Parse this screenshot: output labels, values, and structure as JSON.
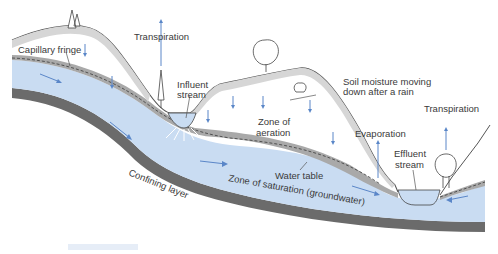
{
  "diagram": {
    "labels": {
      "capillary_fringe": "Capillary fringe",
      "transpiration_left": "Transpiration",
      "influent_stream_1": "Influent",
      "influent_stream_2": "stream",
      "soil_moisture_1": "Soil moisture moving",
      "soil_moisture_2": "down after a rain",
      "zone_aeration_1": "Zone of",
      "zone_aeration_2": "aeration",
      "evaporation": "Evaporation",
      "transpiration_right": "Transpiration",
      "effluent_stream_1": "Effluent",
      "effluent_stream_2": "stream",
      "water_table": "Water table",
      "zone_saturation": "Zone of saturation (groundwater)",
      "confining_layer": "Confining layer"
    },
    "colors": {
      "groundwater": "#c9dcf2",
      "capillary_fringe": "#a9a9a9",
      "soil": "#d6d6d6",
      "confining_layer": "#6b6b6b",
      "arrows": "#5a86c8",
      "text": "#3a3a3a"
    }
  }
}
